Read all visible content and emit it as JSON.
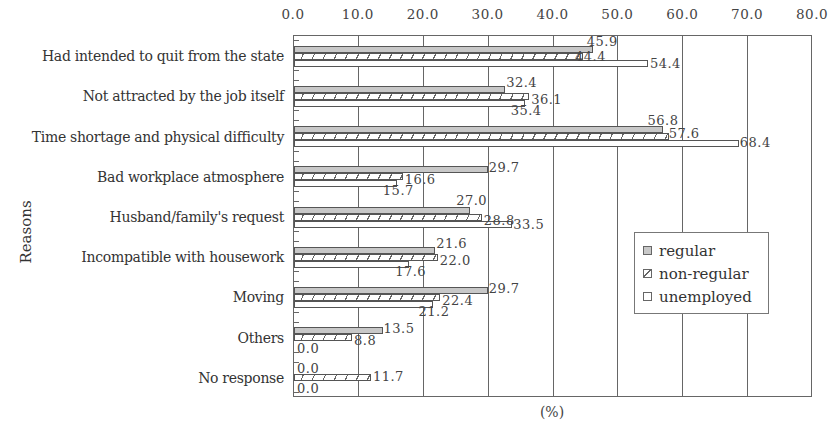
{
  "chart_data": {
    "type": "bar",
    "orientation": "horizontal",
    "title": "",
    "xlabel": "(%)",
    "ylabel": "Reasons",
    "xlim": [
      0,
      80
    ],
    "xticks": [
      "0.0",
      "10.0",
      "20.0",
      "30.0",
      "40.0",
      "50.0",
      "60.0",
      "70.0",
      "80.0"
    ],
    "x_axis_position": "top",
    "grid": true,
    "legend_position": "inside-right",
    "categories": [
      "Had intended to quit from the state",
      "Not attracted by the job itself",
      "Time shortage and physical difficulty",
      "Bad workplace atmosphere",
      "Husband/family's request",
      "Incompatible with housework",
      "Moving",
      "Others",
      "No response"
    ],
    "series": [
      {
        "name": "regular",
        "key": "regular",
        "pattern": "solid-gray",
        "color": "#c8c8c8",
        "values": [
          45.9,
          32.4,
          56.8,
          29.7,
          27.0,
          21.6,
          29.7,
          13.5,
          0.0
        ],
        "labels": [
          "45.9",
          "32.4",
          "56.8",
          "29.7",
          "27.0",
          "21.6",
          "29.7",
          "13.5",
          "0.0"
        ]
      },
      {
        "name": "non-regular",
        "key": "nonregular",
        "pattern": "diagonal-hatch",
        "color": "#666666",
        "values": [
          44.4,
          36.1,
          57.6,
          16.6,
          28.8,
          22.0,
          22.4,
          8.8,
          11.7
        ],
        "labels": [
          "44.4",
          "36.1",
          "57.6",
          "16.6",
          "28.8",
          "22.0",
          "22.4",
          "8.8",
          "11.7"
        ]
      },
      {
        "name": "unemployed",
        "key": "unemployed",
        "pattern": "white",
        "color": "#ffffff",
        "values": [
          54.4,
          35.4,
          68.4,
          15.7,
          33.5,
          17.6,
          21.2,
          0.0,
          0.0
        ],
        "labels": [
          "54.4",
          "35.4",
          "68.4",
          "15.7",
          "33.5",
          "17.6",
          "21.2",
          "0.0",
          "0.0"
        ]
      }
    ]
  }
}
